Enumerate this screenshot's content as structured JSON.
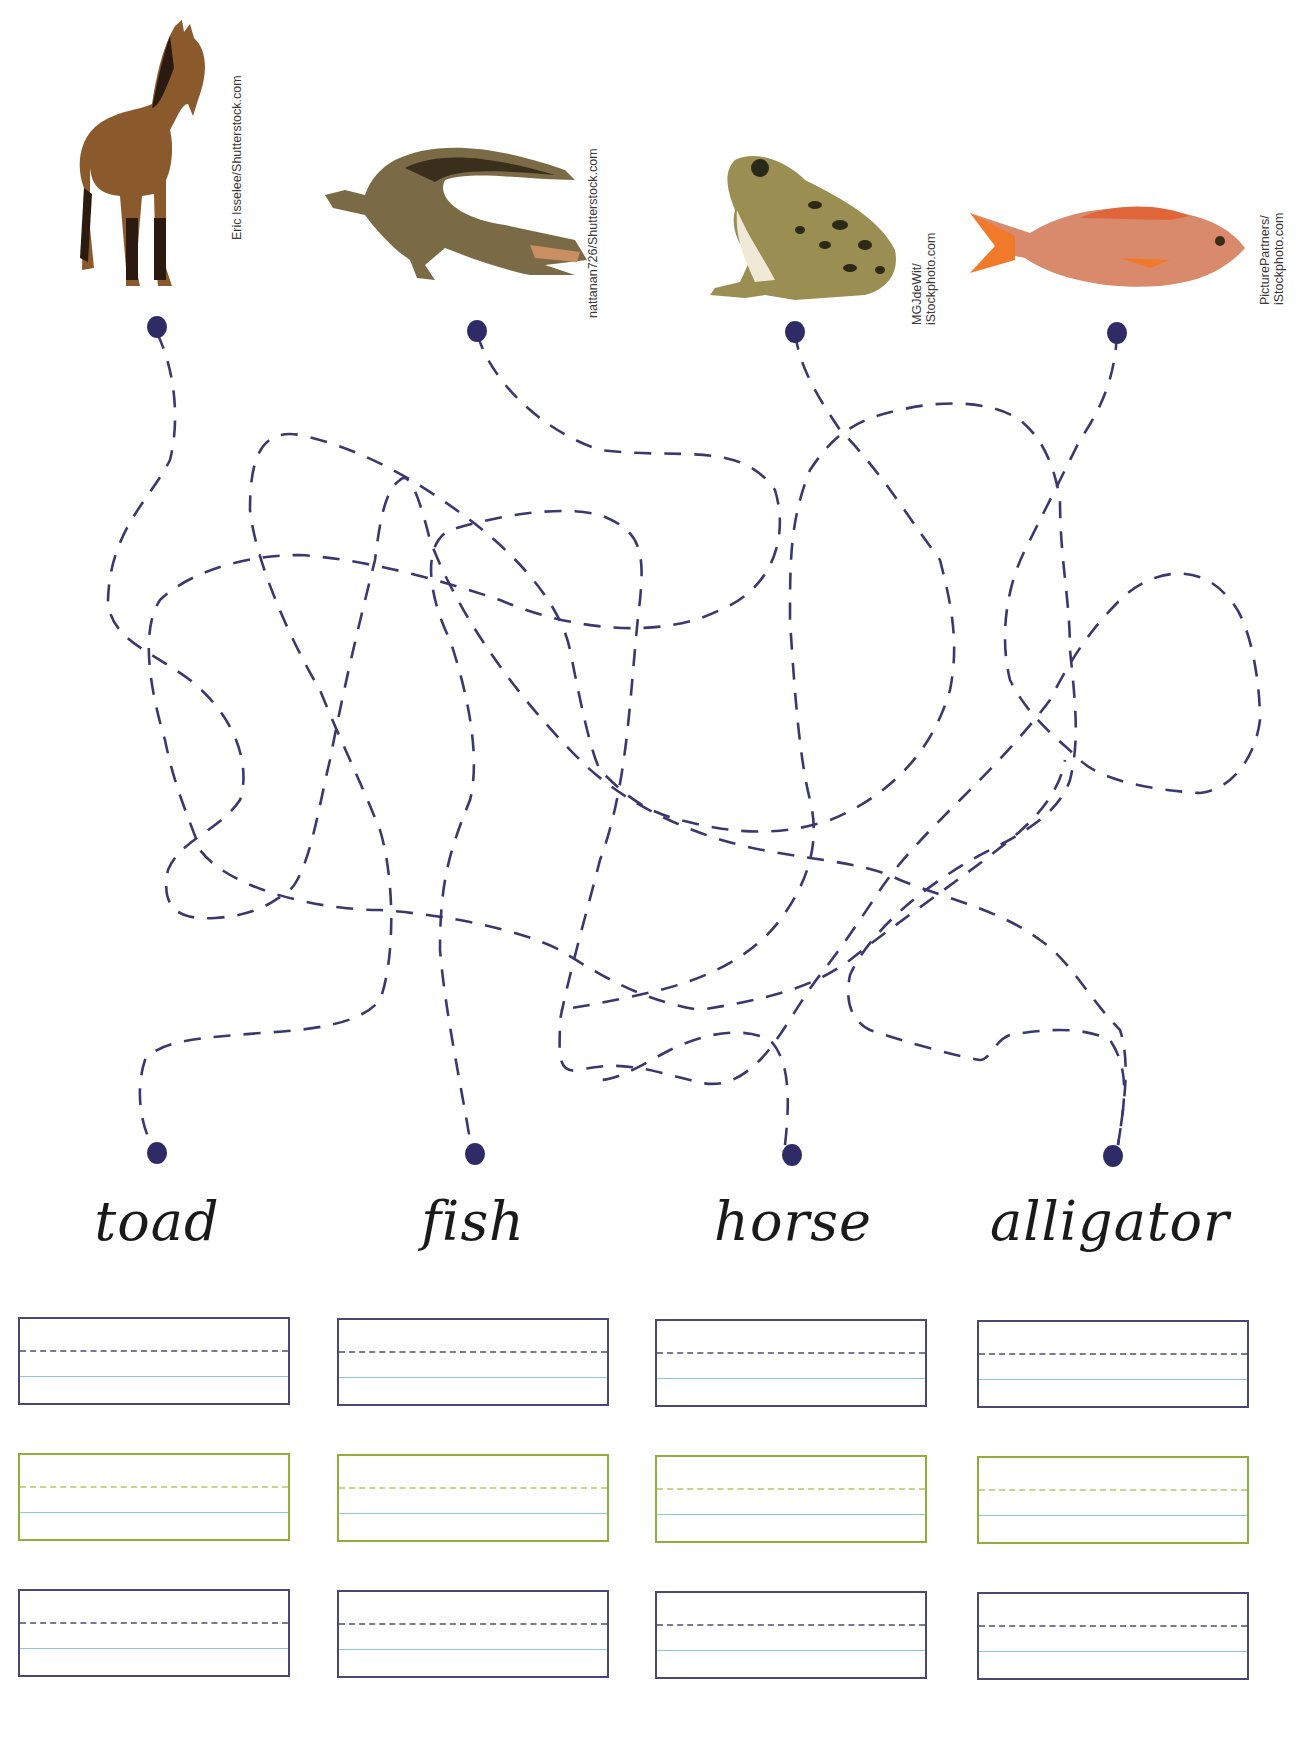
{
  "worksheet": {
    "activity": "Trace the tangled lines to match each animal picture to its name, then write the name.",
    "animals": [
      {
        "name": "horse",
        "credit_lines": [
          "Eric Isselee/Shutterstock.com"
        ]
      },
      {
        "name": "alligator",
        "credit_lines": [
          "nattanan726/Shutterstock.com"
        ]
      },
      {
        "name": "toad",
        "credit_lines": [
          "MGJdeWit/",
          "iStockphoto.com"
        ]
      },
      {
        "name": "fish",
        "credit_lines": [
          "PicturePartners/",
          "iStockphoto.com"
        ]
      }
    ],
    "words": [
      "toad",
      "fish",
      "horse",
      "alligator"
    ],
    "colors": {
      "dot": "#2e2b66",
      "dash": "#3b3870",
      "box_border": "#4a4775",
      "box_border_alt": "#8fae3a",
      "baseline": "#8ccfc8"
    },
    "writing_rows": 3
  }
}
